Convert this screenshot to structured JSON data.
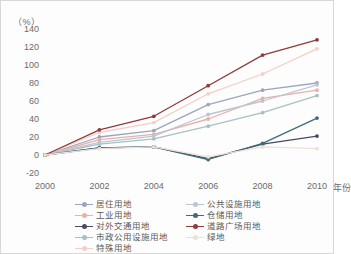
{
  "chart_data": {
    "type": "line",
    "title": "",
    "unit_label": "（%）",
    "xlabel": "年份",
    "ylabel": "",
    "x": [
      2000,
      2002,
      2004,
      2006,
      2008,
      2010
    ],
    "categories": [
      "2000",
      "2002",
      "2004",
      "2006",
      "2008",
      "2010"
    ],
    "xticklabels": [
      "2000",
      "2002",
      "2004",
      "2006",
      "2008",
      "2010"
    ],
    "yticklabels": [
      "140",
      "120",
      "100",
      "80",
      "60",
      "40",
      "20",
      "0",
      "-20"
    ],
    "yticks": [
      140,
      120,
      100,
      80,
      60,
      40,
      20,
      0,
      -20
    ],
    "ylim": [
      -20,
      140
    ],
    "xlim": [
      2000,
      2010
    ],
    "grid": false,
    "legend_position": "bottom",
    "series": [
      {
        "name": "居住用地",
        "color": "#9aa6bb",
        "values": [
          0,
          20,
          27,
          56,
          72,
          80
        ]
      },
      {
        "name": "工业用地",
        "color": "#e8b0a8",
        "values": [
          0,
          17,
          23,
          40,
          63,
          72
        ]
      },
      {
        "name": "对外交通用地",
        "color": "#4a4a5e",
        "values": [
          0,
          8,
          9,
          -4,
          12,
          21
        ]
      },
      {
        "name": "市政公用设施用地",
        "color": "#a8c0c4",
        "values": [
          0,
          12,
          18,
          32,
          47,
          66
        ]
      },
      {
        "name": "特殊用地",
        "color": "#f3cfc8",
        "values": [
          0,
          25,
          36,
          68,
          90,
          118
        ]
      },
      {
        "name": "公共设施用地",
        "color": "#bcc6d2",
        "values": [
          0,
          14,
          21,
          45,
          60,
          78
        ]
      },
      {
        "name": "仓储用地",
        "color": "#3f6b78",
        "values": [
          0,
          8,
          9,
          -5,
          13,
          41
        ]
      },
      {
        "name": "道路广场用地",
        "color": "#8e3b3b",
        "values": [
          0,
          28,
          43,
          77,
          111,
          128
        ]
      },
      {
        "name": "绿地",
        "color": "#f0ded8",
        "values": [
          0,
          7,
          9,
          -2,
          9,
          7
        ]
      }
    ]
  },
  "legend": {
    "columns": [
      {
        "items": [
          {
            "label": "居住用地",
            "color": "#9aa6bb"
          },
          {
            "label": "工业用地",
            "color": "#e8b0a8"
          },
          {
            "label": "对外交通用地",
            "color": "#4a4a5e"
          },
          {
            "label": "市政公用设施用地",
            "color": "#a8c0c4"
          },
          {
            "label": "特殊用地",
            "color": "#f3cfc8"
          }
        ]
      },
      {
        "items": [
          {
            "label": "公共设施用地",
            "color": "#bcc6d2"
          },
          {
            "label": "仓储用地",
            "color": "#3f6b78"
          },
          {
            "label": "道路广场用地",
            "color": "#8e3b3b"
          },
          {
            "label": "绿地",
            "color": "#f0ded8"
          }
        ]
      }
    ]
  }
}
